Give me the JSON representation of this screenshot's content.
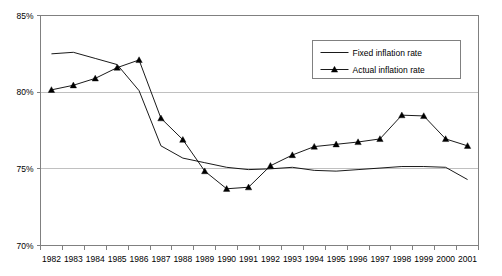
{
  "chart_data": {
    "type": "line",
    "title": "",
    "xlabel": "",
    "ylabel": "",
    "grid": true,
    "legend_position": "top-right",
    "ylim": [
      70,
      85
    ],
    "ytick_labels": [
      "85%",
      "80%",
      "75%",
      "70%"
    ],
    "ytick_values": [
      85,
      80,
      75,
      70
    ],
    "categories": [
      "1982",
      "1983",
      "1984",
      "1985",
      "1986",
      "1987",
      "1988",
      "1989",
      "1990",
      "1991",
      "1992",
      "1993",
      "1994",
      "1995",
      "1996",
      "1997",
      "1998",
      "1999",
      "2000",
      "2001"
    ],
    "series": [
      {
        "name": "Fixed inflation rate",
        "marker": "none",
        "color": "#000000",
        "values": [
          82.5,
          82.6,
          82.2,
          81.8,
          80.1,
          76.5,
          75.7,
          75.4,
          75.1,
          74.95,
          75.0,
          75.1,
          74.9,
          74.85,
          74.95,
          75.05,
          75.15,
          75.15,
          75.1,
          74.3
        ]
      },
      {
        "name": "Actual inflation rate",
        "marker": "triangle",
        "color": "#000000",
        "values": [
          80.15,
          80.45,
          80.9,
          81.6,
          82.1,
          78.3,
          76.9,
          74.85,
          73.7,
          73.8,
          75.2,
          75.9,
          76.45,
          76.6,
          76.75,
          76.95,
          78.5,
          78.45,
          76.95,
          76.5
        ]
      }
    ]
  },
  "legend": {
    "items": [
      {
        "label": "Fixed inflation rate",
        "marker": "line"
      },
      {
        "label": "Actual inflation rate",
        "marker": "line-triangle"
      }
    ]
  }
}
